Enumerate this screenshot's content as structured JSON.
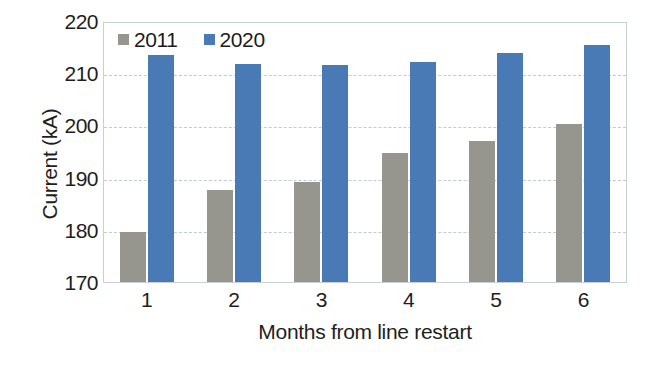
{
  "chart_data": {
    "type": "bar",
    "title": "",
    "subtitle": "",
    "xlabel": "Months from line restart",
    "ylabel": "Current (kA)",
    "categories": [
      "1",
      "2",
      "3",
      "4",
      "5",
      "6"
    ],
    "series": [
      {
        "name": "2011",
        "color": "#96968e",
        "values": [
          179.6,
          187.6,
          189.2,
          194.8,
          197.0,
          200.2
        ]
      },
      {
        "name": "2020",
        "color": "#4a7ab5",
        "values": [
          213.4,
          211.7,
          211.6,
          212.2,
          213.8,
          215.5
        ]
      }
    ],
    "ylim": [
      170,
      220
    ],
    "yticks": [
      170,
      180,
      190,
      200,
      210,
      220
    ],
    "ytick_labels": [
      "170",
      "180",
      "190",
      "200",
      "210",
      "220"
    ],
    "grid": true,
    "grid_axis": "y",
    "grid_style": "dashed",
    "legend_position": "top-left",
    "bar_group_gap_ratio": 0.36,
    "axis_frame": true
  },
  "colors": {
    "series_2011": "#96968e",
    "series_2020": "#4a7ab5",
    "grid": "#c2cad4",
    "axis": "#c9cfd6",
    "text": "#1e1e1e",
    "background": "#ffffff"
  }
}
